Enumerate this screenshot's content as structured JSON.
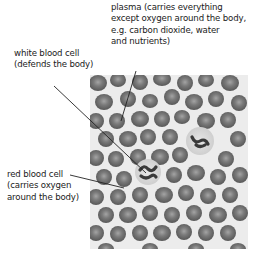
{
  "figure": {
    "labels": [
      {
        "id": "plasma",
        "lines": [
          "plasma (carries everything",
          "except oxygen around the body,",
          "e.g. carbon dioxide, water",
          "and nutrients)"
        ]
      },
      {
        "id": "white-blood-cell",
        "lines": [
          "white blood cell",
          "(defends the body)"
        ]
      },
      {
        "id": "red-blood-cell",
        "lines": [
          "red blood cell",
          "(carries oxygen",
          "around the body)"
        ]
      }
    ]
  },
  "colors": {
    "background": "#ffffff",
    "text": "#1a1a1a",
    "leader_line": "#222222",
    "photo_background": "#ececec",
    "red_cell_fill": "#6e6e6e",
    "red_cell_center": "#9a9a9a",
    "white_cell_fill": "#dcdcdc",
    "white_cell_nucleus": "#3a3a3a"
  }
}
